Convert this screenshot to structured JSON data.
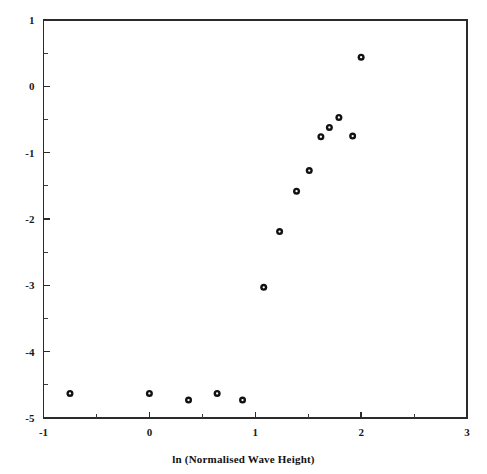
{
  "chart_data": {
    "type": "scatter",
    "title": "",
    "subtitle": "",
    "xlabel": "ln (Normalised Wave Height)",
    "ylabel": "",
    "xlim": [
      -1,
      3
    ],
    "ylim": [
      -5,
      1
    ],
    "grid": false,
    "legend": null,
    "x_major_ticks": [
      -1,
      0,
      1,
      2,
      3
    ],
    "x_major_tick_labels": [
      "-1",
      "0",
      "1",
      "2",
      "3"
    ],
    "x_minor_ticks": [
      -0.5,
      0.5,
      1.5,
      2.5
    ],
    "y_major_ticks": [
      1,
      0,
      -1,
      -2,
      -3,
      -4,
      -5
    ],
    "y_major_tick_labels": [
      "1",
      "0",
      "-1",
      "-2",
      "-3",
      "-4",
      "-5"
    ],
    "y_minor_ticks": [
      0.5,
      -0.5,
      -1.5,
      -2.5,
      -3.5,
      -4.5
    ],
    "marker": "open-circle",
    "marker_color": "#111111",
    "points": [
      {
        "x": -0.75,
        "y": -4.63
      },
      {
        "x": 0.0,
        "y": -4.63
      },
      {
        "x": 0.37,
        "y": -4.73
      },
      {
        "x": 0.64,
        "y": -4.63
      },
      {
        "x": 0.88,
        "y": -4.73
      },
      {
        "x": 1.08,
        "y": -3.03
      },
      {
        "x": 1.23,
        "y": -2.19
      },
      {
        "x": 1.39,
        "y": -1.58
      },
      {
        "x": 1.51,
        "y": -1.27
      },
      {
        "x": 1.62,
        "y": -0.76
      },
      {
        "x": 1.7,
        "y": -0.62
      },
      {
        "x": 1.79,
        "y": -0.47
      },
      {
        "x": 1.92,
        "y": -0.75
      },
      {
        "x": 2.0,
        "y": 0.44
      }
    ]
  },
  "axes": {
    "x_title": "ln (Normalised Wave Height)"
  },
  "colors": {
    "axis": "#2b2b2b",
    "marker": "#111111",
    "background": "#ffffff"
  }
}
